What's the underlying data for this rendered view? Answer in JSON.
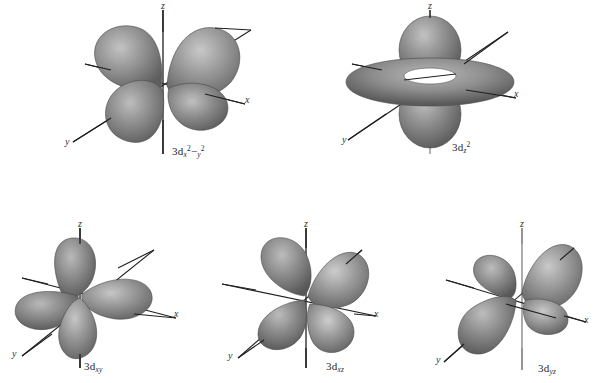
{
  "figure": {
    "background_color": "#ffffff",
    "lobe_color_light": "#b0b0b0",
    "lobe_color_mid": "#8a8a8a",
    "lobe_color_dark": "#5d5d5d",
    "axis_color": "#1f1f1f"
  },
  "orbitals": [
    {
      "id": "3d-x2-y2",
      "name": "3d x squared minus y squared orbital",
      "label_prefix": "3d",
      "label_sub_x": "x",
      "label_sup_x": "2",
      "label_minus": "−",
      "label_sub_y": "y",
      "label_sup_y": "2",
      "caption_plain": "3d x2−y2",
      "axes": {
        "z": "z",
        "x": "x",
        "y": "y"
      },
      "lobe_count": 4,
      "lobe_orientation": "along x and y axes, in xy-plane",
      "row": 1,
      "column": 1
    },
    {
      "id": "3d-z2",
      "name": "3d z squared orbital",
      "label_prefix": "3d",
      "label_sub_z": "z",
      "label_sup_z": "2",
      "caption_plain": "3d z2",
      "axes": {
        "z": "z",
        "x": "x",
        "y": "y"
      },
      "lobe_count": 2,
      "lobe_orientation": "two lobes along z axis plus a torus ring in xy-plane",
      "row": 1,
      "column": 2
    },
    {
      "id": "3d-xy",
      "name": "3d xy orbital",
      "label_prefix": "3d",
      "label_sub": "xy",
      "caption_plain": "3d xy",
      "axes": {
        "z": "z",
        "x": "x",
        "y": "y"
      },
      "lobe_count": 4,
      "lobe_orientation": "between x and y axes, in xy-plane",
      "row": 2,
      "column": 1
    },
    {
      "id": "3d-xz",
      "name": "3d xz orbital",
      "label_prefix": "3d",
      "label_sub": "xz",
      "caption_plain": "3d xz",
      "axes": {
        "z": "z",
        "x": "x",
        "y": "y"
      },
      "lobe_count": 4,
      "lobe_orientation": "between x and z axes, in xz-plane",
      "row": 2,
      "column": 2
    },
    {
      "id": "3d-yz",
      "name": "3d yz orbital",
      "label_prefix": "3d",
      "label_sub": "yz",
      "caption_plain": "3d yz",
      "axes": {
        "z": "z",
        "x": "x",
        "y": "y"
      },
      "lobe_count": 4,
      "lobe_orientation": "between y and z axes, in yz-plane",
      "row": 2,
      "column": 3
    }
  ]
}
